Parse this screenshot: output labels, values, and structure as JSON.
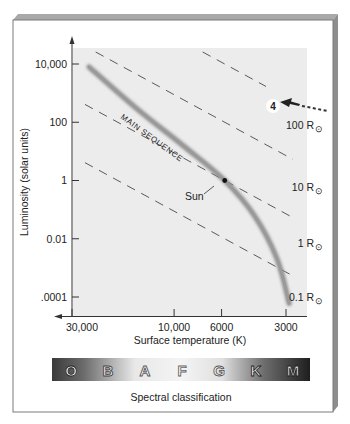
{
  "figure": {
    "step_marker": "4",
    "spectral_title": "Spectral classification",
    "spectral_classes": [
      "O",
      "B",
      "A",
      "F",
      "G",
      "K",
      "M"
    ]
  },
  "chart_data": {
    "type": "scatter",
    "title": "",
    "xlabel": "Surface temperature (K)",
    "ylabel": "Luminosity (solar units)",
    "x_scale": "log",
    "x_reversed": true,
    "y_scale": "log",
    "x_ticks": [
      {
        "value": 30000,
        "label": "30,000"
      },
      {
        "value": 10000,
        "label": "10,000"
      },
      {
        "value": 6000,
        "label": "6000"
      },
      {
        "value": 3000,
        "label": "3000"
      }
    ],
    "y_ticks": [
      {
        "value": 10000,
        "label": "10,000"
      },
      {
        "value": 100,
        "label": "100"
      },
      {
        "value": 1,
        "label": "1"
      },
      {
        "value": 0.01,
        "label": "0.01"
      },
      {
        "value": 0.0001,
        "label": ".0001"
      }
    ],
    "main_sequence": {
      "label": "MAIN SEQUENCE",
      "points": [
        {
          "T": 25000,
          "L": 8000
        },
        {
          "T": 15000,
          "L": 300
        },
        {
          "T": 9000,
          "L": 15
        },
        {
          "T": 5800,
          "L": 1
        },
        {
          "T": 4200,
          "L": 0.06
        },
        {
          "T": 3300,
          "L": 0.002
        },
        {
          "T": 2900,
          "L": 6e-05
        }
      ]
    },
    "sun": {
      "label": "Sun",
      "T": 5800,
      "L": 1
    },
    "radius_lines": [
      {
        "label": "100 R",
        "radius_solar": 100
      },
      {
        "label": "10 R",
        "radius_solar": 10
      },
      {
        "label": "1 R",
        "radius_solar": 1
      },
      {
        "label": "0.1 R",
        "radius_solar": 0.1
      }
    ],
    "sun_symbol": "⊙",
    "grid": false,
    "legend": "none"
  }
}
